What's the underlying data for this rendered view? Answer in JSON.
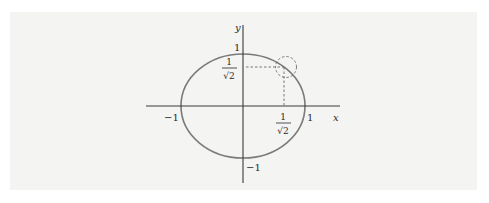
{
  "figure": {
    "axes": {
      "x_label": "x",
      "y_label": "y"
    },
    "tick_labels": {
      "x_pos_one": "1",
      "x_neg_one": "−1",
      "y_pos_one": "1",
      "y_neg_one": "−1",
      "x_frac_num": "1",
      "x_frac_den": "√2",
      "y_frac_num": "1",
      "y_frac_den": "√2"
    },
    "highlight_point": {
      "x": "1/√2",
      "y": "1/√2",
      "marker": "dashed-circle"
    },
    "colors": {
      "curve": "#7a7a7a",
      "axes": "#3a3a3a",
      "dashed": "#6a6a6a",
      "panel": "#f4f4f3"
    }
  }
}
